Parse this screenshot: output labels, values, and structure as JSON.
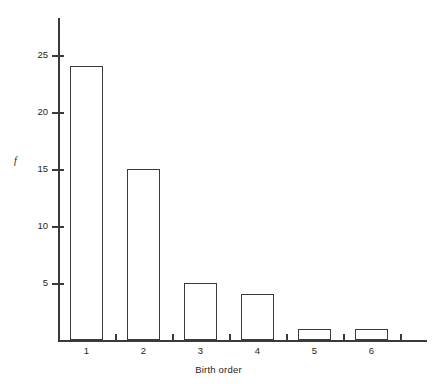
{
  "chart_data": {
    "type": "bar",
    "title": "",
    "subtitle": "",
    "xlabel": "Birth order",
    "ylabel": "f",
    "categories": [
      "1",
      "2",
      "3",
      "4",
      "5",
      "6"
    ],
    "values": [
      24,
      15,
      5,
      4,
      1,
      1
    ],
    "series": [
      {
        "name": "f",
        "values": [
          24,
          15,
          5,
          4,
          1,
          1
        ]
      }
    ],
    "ylim": [
      0,
      27
    ],
    "yticks": [
      5,
      10,
      15,
      20,
      25
    ],
    "ytick_labels": [
      "5",
      "10",
      "15",
      "20",
      "25"
    ],
    "xtick_labels": [
      "1",
      "2",
      "3",
      "4",
      "5",
      "6"
    ],
    "grid": false,
    "legend": "none",
    "bar_fill": "#ffffff",
    "bar_edge": "#3a3a3a",
    "axis_color": "#3a3a3a",
    "text_color": "#231f20",
    "background": "#ffffff"
  }
}
